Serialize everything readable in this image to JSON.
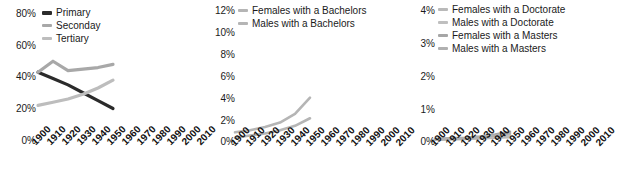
{
  "chart_data": [
    {
      "type": "line",
      "title": "",
      "xlabel": "",
      "ylabel": "",
      "x": [
        1900,
        1910,
        1920,
        1930,
        1940,
        1950
      ],
      "xlim": [
        1900,
        2010
      ],
      "ylim": [
        0,
        0.8
      ],
      "yticks": [
        "0%",
        "20%",
        "40%",
        "60%",
        "80%"
      ],
      "ytick_values": [
        0,
        20,
        40,
        60,
        80
      ],
      "xticks": [
        "1900",
        "1910",
        "1920",
        "1930",
        "1940",
        "1950",
        "1960",
        "1970",
        "1980",
        "1990",
        "2000",
        "2010"
      ],
      "grid": false,
      "legend_position": "top-left",
      "series": [
        {
          "name": "Primary",
          "color": "#2b2b2b",
          "values": [
            43,
            39,
            35,
            30,
            25,
            20
          ]
        },
        {
          "name": "Seconday",
          "color": "#a8a8a8",
          "values": [
            43,
            50,
            44,
            45,
            46,
            48
          ]
        },
        {
          "name": "Tertiary",
          "color": "#bdbdbd",
          "values": [
            22,
            24,
            26,
            29,
            33,
            38
          ]
        }
      ]
    },
    {
      "type": "line",
      "title": "",
      "xlabel": "",
      "ylabel": "",
      "x": [
        1900,
        1910,
        1920,
        1930,
        1940,
        1950
      ],
      "xlim": [
        1900,
        2010
      ],
      "ylim": [
        0,
        12
      ],
      "yticks": [
        "0%",
        "2%",
        "4%",
        "6%",
        "8%",
        "10%",
        "12%"
      ],
      "ytick_values": [
        0,
        2,
        4,
        6,
        8,
        10,
        12
      ],
      "xticks": [
        "1900",
        "1910",
        "1920",
        "1930",
        "1940",
        "1950",
        "1960",
        "1970",
        "1980",
        "1990",
        "2000",
        "2010"
      ],
      "grid": false,
      "legend_position": "top-left",
      "series": [
        {
          "name": "Females with a Bachelors",
          "color": "#b5b5b5",
          "values": [
            0.8,
            1.0,
            1.3,
            1.7,
            2.5,
            4.0
          ]
        },
        {
          "name": "Males with a Bachelors",
          "color": "#b5b5b5",
          "values": [
            0.3,
            0.5,
            0.7,
            1.0,
            1.4,
            2.1
          ]
        }
      ]
    },
    {
      "type": "line",
      "title": "",
      "xlabel": "",
      "ylabel": "",
      "x": [
        1900,
        1910,
        1920,
        1930,
        1940,
        1950
      ],
      "xlim": [
        1900,
        2010
      ],
      "ylim": [
        0,
        4
      ],
      "yticks": [
        "0%",
        "1%",
        "2%",
        "3%",
        "4%"
      ],
      "ytick_values": [
        0,
        1,
        2,
        3,
        4
      ],
      "xticks": [
        "1900",
        "1910",
        "1920",
        "1930",
        "1940",
        "1950",
        "1960",
        "1970",
        "1980",
        "1990",
        "2000",
        "2010"
      ],
      "grid": false,
      "legend_position": "top-left",
      "series": [
        {
          "name": "Females with a Doctorate",
          "color": "#b9b9b9",
          "values": [
            0.04,
            0.05,
            0.06,
            0.08,
            0.1,
            0.12
          ]
        },
        {
          "name": "Males with a Doctorate",
          "color": "#bfbfbf",
          "values": [
            0.05,
            0.06,
            0.08,
            0.1,
            0.14,
            0.18
          ]
        },
        {
          "name": "Females with a Masters",
          "color": "#a6a6a6",
          "values": [
            0.06,
            0.08,
            0.1,
            0.14,
            0.2,
            0.28
          ]
        },
        {
          "name": "Males with a Masters",
          "color": "#b0b0b0",
          "values": [
            0.05,
            0.07,
            0.09,
            0.12,
            0.17,
            0.24
          ]
        }
      ]
    }
  ]
}
